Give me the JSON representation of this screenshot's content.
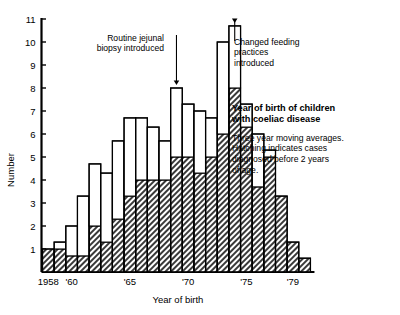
{
  "chart_data": {
    "type": "bar",
    "title": "Year of birth of children with coeliac disease",
    "subtitle": "Three year moving averages. Hatching indicates cases diagnosed before 2 years of age.",
    "xlabel": "Year of birth",
    "ylabel": "Number",
    "ylim": [
      0,
      11
    ],
    "ytick_labels": [
      "1",
      "2",
      "3",
      "4",
      "5",
      "6",
      "7",
      "8",
      "9",
      "10",
      "11"
    ],
    "ytick_values": [
      1,
      2,
      3,
      4,
      5,
      6,
      7,
      8,
      9,
      10,
      11
    ],
    "xtick_labels": [
      "1958",
      "'60",
      "'65",
      "'70",
      "'75",
      "'79"
    ],
    "xtick_values": [
      1958,
      1960,
      1965,
      1970,
      1975,
      1979
    ],
    "grid": false,
    "legend_position": "inside-right",
    "categories": [
      1958,
      1959,
      1960,
      1961,
      1962,
      1963,
      1964,
      1965,
      1966,
      1967,
      1968,
      1969,
      1970,
      1971,
      1972,
      1973,
      1974,
      1975,
      1976,
      1977,
      1978,
      1979,
      1980
    ],
    "series": [
      {
        "name": "Total (three year moving average)",
        "values": [
          1.0,
          1.3,
          2.0,
          3.3,
          4.7,
          4.3,
          5.7,
          6.7,
          6.7,
          6.3,
          5.7,
          8.0,
          7.3,
          7.0,
          6.7,
          10.0,
          10.7,
          7.3,
          6.0,
          5.3,
          3.3,
          1.3,
          0.6
        ]
      },
      {
        "name": "Diagnosed before 2 years of age (hatched)",
        "values": [
          1.0,
          1.0,
          0.7,
          0.7,
          2.0,
          1.3,
          2.3,
          3.3,
          4.0,
          4.0,
          4.0,
          5.0,
          5.0,
          4.3,
          5.0,
          6.0,
          8.0,
          6.3,
          3.7,
          5.0,
          3.3,
          1.3,
          0.6
        ]
      }
    ],
    "annotations": [
      {
        "id": "jejunal",
        "text": "Routine jejunal\nbiopsy introduced",
        "points_to_year": 1969,
        "arrow": true
      },
      {
        "id": "feeding",
        "text": "Changed feeding\npractices\nintroduced",
        "points_to_year": 1974,
        "arrow": true
      }
    ]
  },
  "legend": {
    "title": "Year of birth of children\nwith coeliac disease",
    "body": "Three year moving averages.\nHatching indicates cases\ndiagnosed before 2 years\nof age."
  },
  "colors": {
    "axis": "#000000",
    "bar_outline": "#000000",
    "bar_fill": "#ffffff",
    "hatch": "#1a1a1a",
    "background": "#ffffff"
  }
}
